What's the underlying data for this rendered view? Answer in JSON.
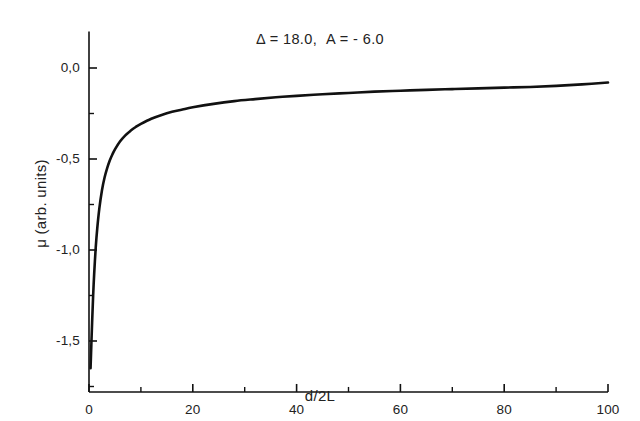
{
  "figure": {
    "background_color": "#ffffff",
    "ink_color": "#111111"
  },
  "chart_data": {
    "type": "line",
    "title": "",
    "subtitle": "",
    "annotation": "Δ = 18.0,  A = - 6.0",
    "annotations": [
      {
        "text": "Δ = 18.0,  A = - 6.0",
        "x": 50,
        "y": 0.13,
        "halign": "center"
      }
    ],
    "xlabel": "d/2L",
    "ylabel": "μ (arb. units)",
    "xlim": [
      -1.5,
      103
    ],
    "ylim": [
      -1.78,
      0.2
    ],
    "xticks": [
      0,
      20,
      40,
      60,
      80,
      100
    ],
    "xtick_labels": [
      "0",
      "20",
      "40",
      "60",
      "80",
      "100"
    ],
    "x_minor_ticks": [
      10,
      30,
      50,
      70,
      90
    ],
    "yticks": [
      0.0,
      -0.5,
      -1.0,
      -1.5
    ],
    "ytick_labels": [
      "0,0",
      "-0,5",
      "-1,0",
      "-1,5"
    ],
    "y_minor_ticks": [
      -0.25,
      -0.75,
      -1.25,
      -1.75
    ],
    "grid": false,
    "legend": null,
    "legend_position": "none",
    "spines": [
      "left",
      "bottom"
    ],
    "tick_direction": "in",
    "decimal_separator": "comma",
    "series": [
      {
        "name": "mu",
        "color": "#111111",
        "line_width": 2.6,
        "style": "solid",
        "x": [
          0.3,
          0.45,
          0.6,
          0.8,
          1.0,
          1.3,
          1.6,
          2.0,
          2.5,
          3.0,
          3.5,
          4.0,
          4.5,
          5.0,
          6.0,
          7.0,
          8.0,
          9.0,
          10.0,
          12.0,
          14.0,
          16.0,
          18.0,
          20.0,
          24.0,
          28.0,
          32.0,
          36.0,
          40.0,
          45.0,
          50.0,
          55.0,
          60.0,
          65.0,
          70.0,
          75.0,
          80.0,
          85.0,
          90.0,
          95.0,
          100.0
        ],
        "y": [
          -1.65,
          -1.52,
          -1.4,
          -1.25,
          -1.13,
          -0.985,
          -0.878,
          -0.77,
          -0.672,
          -0.602,
          -0.55,
          -0.508,
          -0.475,
          -0.447,
          -0.403,
          -0.37,
          -0.345,
          -0.324,
          -0.307,
          -0.279,
          -0.258,
          -0.241,
          -0.228,
          -0.216,
          -0.197,
          -0.182,
          -0.171,
          -0.161,
          -0.153,
          -0.144,
          -0.137,
          -0.13,
          -0.125,
          -0.12,
          -0.116,
          -0.112,
          -0.108,
          -0.104,
          -0.098,
          -0.09,
          -0.08
        ]
      }
    ],
    "notes": {
      "asymptote_value": -0.08,
      "minimum_value": -1.65,
      "minimum_at_x": 0.3,
      "crosses_minus_half_at_x": 8
    }
  }
}
